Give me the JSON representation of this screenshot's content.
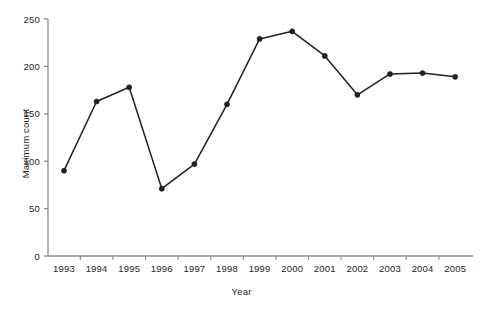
{
  "chart_data": {
    "type": "line",
    "title": "",
    "xlabel": "Year",
    "ylabel": "Maximum count",
    "categories": [
      "1993",
      "1994",
      "1995",
      "1996",
      "1997",
      "1998",
      "1999",
      "2000",
      "2001",
      "2002",
      "2003",
      "2004",
      "2005"
    ],
    "values": [
      90,
      163,
      178,
      71,
      97,
      160,
      229,
      237,
      211,
      170,
      192,
      193,
      189
    ],
    "series": [
      {
        "name": "Maximum count",
        "values": [
          90,
          163,
          178,
          71,
          97,
          160,
          229,
          237,
          211,
          170,
          192,
          193,
          189
        ]
      }
    ],
    "ylim": [
      0,
      250
    ],
    "yticks": [
      0,
      50,
      100,
      150,
      200,
      250
    ],
    "ytick_labels": [
      "0",
      "50",
      "100",
      "150",
      "200",
      "250"
    ],
    "xtick_labels": [
      "1993",
      "1994",
      "1995",
      "1996",
      "1997",
      "1998",
      "1999",
      "2000",
      "2001",
      "2002",
      "2003",
      "2004",
      "2005"
    ],
    "grid": false,
    "legend": false,
    "legend_position": "none",
    "marker": "filled-circle",
    "line_color": "#231f20",
    "marker_color": "#231f20",
    "axis_color": "#8c8c8c",
    "background_color": "#ffffff"
  }
}
